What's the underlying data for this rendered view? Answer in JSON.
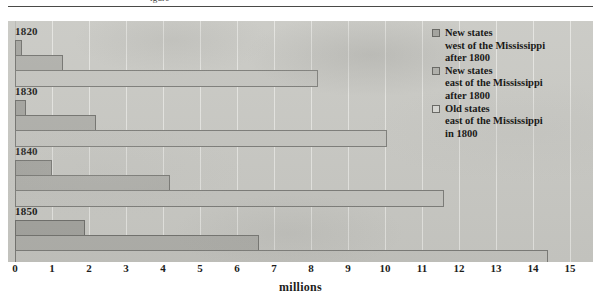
{
  "figure": {
    "caption_fragment": "igure",
    "axis_title": "millions"
  },
  "legend": {
    "position": "right",
    "items": [
      {
        "key": "west",
        "swatch_color": "#a4a49f",
        "lines": [
          "New states",
          "west of the Mississippi",
          "after 1800"
        ]
      },
      {
        "key": "east",
        "swatch_color": "#b0b0ab",
        "lines": [
          "New states",
          "east of the Mississippi",
          "after 1800"
        ]
      },
      {
        "key": "old",
        "swatch_color": "#d5d5d1",
        "lines": [
          "Old states",
          "east of the Mississippi",
          "in 1800"
        ]
      }
    ]
  },
  "chart_data": {
    "type": "bar",
    "orientation": "horizontal",
    "title": "",
    "xlabel": "millions",
    "ylabel": "",
    "xlim": [
      0,
      15
    ],
    "xticks": [
      0,
      1,
      2,
      3,
      4,
      5,
      6,
      7,
      8,
      9,
      10,
      11,
      12,
      13,
      14,
      15
    ],
    "xtick_labels": [
      "0",
      "1",
      "2",
      "3",
      "4",
      "5",
      "6",
      "7",
      "8",
      "9",
      "10",
      "11",
      "12",
      "13",
      "14",
      "15"
    ],
    "grid": true,
    "grid_axis": "x",
    "legend_position": "right",
    "categories": [
      "1820",
      "1830",
      "1840",
      "1850"
    ],
    "series": [
      {
        "name": "New states west of the Mississippi after 1800",
        "key": "west",
        "color": "#a4a49f",
        "values": [
          0.2,
          0.3,
          1.0,
          1.9
        ]
      },
      {
        "name": "New states east of the Mississippi after 1800",
        "key": "east",
        "color": "#b0b0ab",
        "values": [
          1.3,
          2.2,
          4.2,
          6.6
        ]
      },
      {
        "name": "Old states east of the Mississippi in 1800",
        "key": "old",
        "color": "#c4c4bf",
        "values": [
          8.2,
          10.05,
          11.6,
          14.4
        ]
      }
    ]
  }
}
